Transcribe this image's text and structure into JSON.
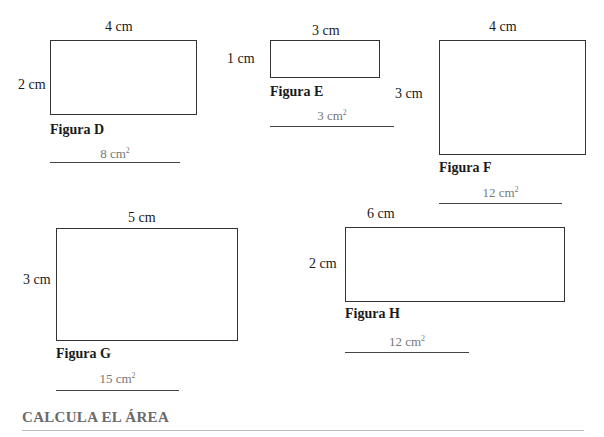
{
  "figures": [
    {
      "id": "D",
      "name": "Figura D",
      "width_label": "4 cm",
      "height_label": "2 cm",
      "answer": "8 cm",
      "answer_exp": "2"
    },
    {
      "id": "E",
      "name": "Figura E",
      "width_label": "3 cm",
      "height_label": "1 cm",
      "answer": "3 cm",
      "answer_exp": "2"
    },
    {
      "id": "F",
      "name": "Figura F",
      "width_label": "4 cm",
      "height_label": "3 cm",
      "answer": "12 cm",
      "answer_exp": "2"
    },
    {
      "id": "G",
      "name": "Figura G",
      "width_label": "5 cm",
      "height_label": "3 cm",
      "answer": "15 cm",
      "answer_exp": "2"
    },
    {
      "id": "H",
      "name": "Figura H",
      "width_label": "6 cm",
      "height_label": "2 cm",
      "answer": "12 cm",
      "answer_exp": "2"
    }
  ],
  "section_title": "CALCULA EL ÁREA"
}
